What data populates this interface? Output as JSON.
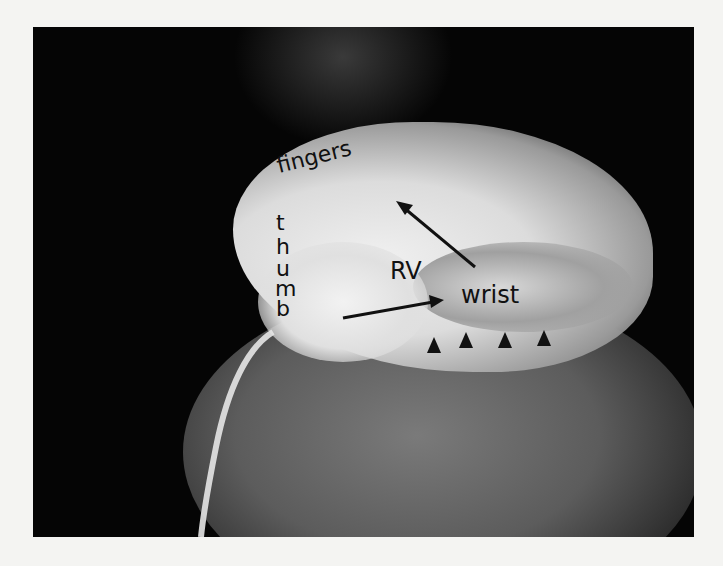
{
  "figure": {
    "type": "angiogram-radiograph",
    "labels": {
      "fingers": "fingers",
      "thumb": [
        "t",
        "h",
        "u",
        "m",
        "b"
      ],
      "rv": "RV",
      "wrist": "wrist"
    },
    "arrowheads_count": 4,
    "colors": {
      "background": "#050505",
      "border": "#f4f4f2",
      "label": "#111111",
      "opacity_bright": "#e8e8e8",
      "opacity_mid": "#6a6a6a"
    }
  }
}
